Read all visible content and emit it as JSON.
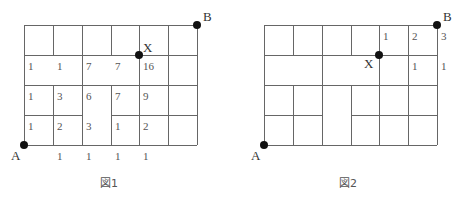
{
  "figure1": {
    "caption": "図1",
    "labels": {
      "A": "A",
      "B": "B",
      "X": "X"
    },
    "row2": [
      "1",
      "1",
      "7",
      "7",
      "16"
    ],
    "row3": [
      "1",
      "3",
      "6",
      "7",
      "9"
    ],
    "row4": [
      "1",
      "2",
      "3",
      "1",
      "2"
    ],
    "bottom": [
      "1",
      "1",
      "1",
      "1"
    ]
  },
  "figure2": {
    "caption": "図2",
    "labels": {
      "A": "A",
      "B": "B",
      "X": "X"
    },
    "top_row": [
      "1",
      "2",
      "3"
    ],
    "second_row": [
      "1",
      "1"
    ]
  }
}
